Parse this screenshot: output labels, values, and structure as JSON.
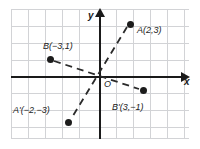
{
  "diagram": {
    "axis_labels": {
      "x": "x",
      "y": "y",
      "origin": "O"
    },
    "colors": {
      "grid": "#d2d3d6",
      "axis": "#1a1a1a",
      "point": "#1c1c1c",
      "dash": "#2a2a2a",
      "background": "#ffffff"
    },
    "grid": {
      "show": true,
      "spacing_px": 17,
      "vertical_lines": [
        0,
        17,
        34,
        51,
        68,
        88,
        105,
        122,
        139,
        156,
        173
      ],
      "horizontal_lines": [
        0,
        17,
        34,
        51,
        67,
        84,
        101,
        118,
        129
      ]
    },
    "points": [
      {
        "name": "A",
        "label": "A(2,3)",
        "x": 2,
        "y": 3,
        "px": 130,
        "py": 24,
        "label_px": 137,
        "label_py": 25
      },
      {
        "name": "B",
        "label": "B(−3,1)",
        "x": -3,
        "y": 1,
        "px": 50,
        "py": 59,
        "label_px": 43,
        "label_py": 41
      },
      {
        "name": "A'",
        "label": "A'(−2,−3)",
        "x": -2,
        "y": -3,
        "px": 68,
        "py": 122,
        "label_px": 13,
        "label_py": 105
      },
      {
        "name": "B'",
        "label": "B'(3,−1)",
        "x": 3,
        "y": -1,
        "px": 143,
        "py": 90,
        "label_px": 112,
        "label_py": 102
      }
    ],
    "segments": [
      {
        "name": "A-to-A-prime",
        "from": "A",
        "to": "A'",
        "style": "dashed"
      },
      {
        "name": "B-to-B-prime",
        "from": "B",
        "to": "B'",
        "style": "dashed"
      }
    ]
  }
}
